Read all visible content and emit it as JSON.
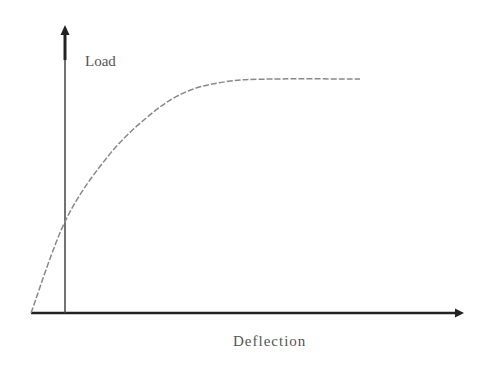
{
  "chart_data": {
    "type": "line",
    "title": "",
    "xlabel": "Deflection",
    "ylabel": "Load",
    "grid": false,
    "legend": "none",
    "series": [
      {
        "name": "load-deflection curve",
        "x": [
          0,
          0.08,
          0.18,
          0.28,
          0.36,
          0.45,
          0.55,
          0.75
        ],
        "y": [
          0,
          0.4,
          0.68,
          0.86,
          0.95,
          0.99,
          1.0,
          1.0
        ]
      }
    ],
    "xlim": [
      0,
      1.0
    ],
    "ylim": [
      0,
      1.2
    ]
  },
  "colors": {
    "axis": "#222222",
    "curve": "#888888",
    "text": "#555555"
  }
}
